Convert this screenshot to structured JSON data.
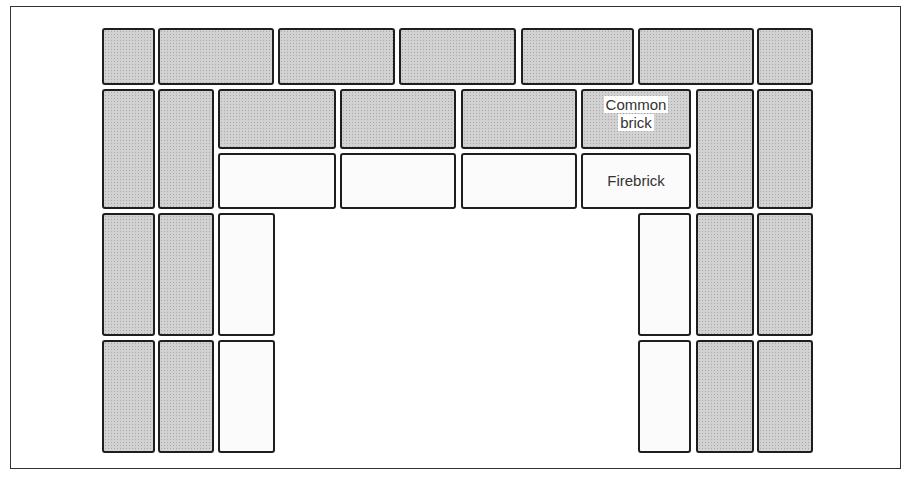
{
  "diagram": {
    "title": "",
    "type": "fireplace brick layout",
    "colors": {
      "common_brick": "#d2d2d2",
      "firebrick": "#fbfbfb",
      "outline": "#1e1e1e"
    },
    "labels": {
      "common_brick_line1": "Common",
      "common_brick_line2": "brick",
      "firebrick": "Firebrick"
    },
    "bricks": [
      {
        "id": "top-1",
        "kind": "common",
        "x": 102,
        "y": 28,
        "w": 53,
        "h": 57
      },
      {
        "id": "top-2",
        "kind": "common",
        "x": 158,
        "y": 28,
        "w": 116,
        "h": 57
      },
      {
        "id": "top-3",
        "kind": "common",
        "x": 278,
        "y": 28,
        "w": 117,
        "h": 57
      },
      {
        "id": "top-4",
        "kind": "common",
        "x": 399,
        "y": 28,
        "w": 117,
        "h": 57
      },
      {
        "id": "top-5",
        "kind": "common",
        "x": 521,
        "y": 28,
        "w": 113,
        "h": 57
      },
      {
        "id": "top-6",
        "kind": "common",
        "x": 638,
        "y": 28,
        "w": 116,
        "h": 57
      },
      {
        "id": "top-7",
        "kind": "common",
        "x": 757,
        "y": 28,
        "w": 56,
        "h": 57
      },
      {
        "id": "r2-left-1",
        "kind": "common",
        "x": 102,
        "y": 89,
        "w": 53,
        "h": 120
      },
      {
        "id": "r2-left-2",
        "kind": "common",
        "x": 158,
        "y": 89,
        "w": 56,
        "h": 120
      },
      {
        "id": "lintel-common-1",
        "kind": "common",
        "x": 218,
        "y": 89,
        "w": 118,
        "h": 60
      },
      {
        "id": "lintel-common-2",
        "kind": "common",
        "x": 340,
        "y": 89,
        "w": 116,
        "h": 60
      },
      {
        "id": "lintel-common-3",
        "kind": "common",
        "x": 461,
        "y": 89,
        "w": 116,
        "h": 60
      },
      {
        "id": "lintel-common-4",
        "kind": "common",
        "x": 581,
        "y": 89,
        "w": 110,
        "h": 60
      },
      {
        "id": "lintel-fire-1",
        "kind": "fire",
        "x": 218,
        "y": 153,
        "w": 118,
        "h": 56
      },
      {
        "id": "lintel-fire-2",
        "kind": "fire",
        "x": 340,
        "y": 153,
        "w": 116,
        "h": 56
      },
      {
        "id": "lintel-fire-3",
        "kind": "fire",
        "x": 461,
        "y": 153,
        "w": 116,
        "h": 56
      },
      {
        "id": "lintel-fire-4",
        "kind": "fire",
        "x": 581,
        "y": 153,
        "w": 110,
        "h": 56
      },
      {
        "id": "r2-right-1",
        "kind": "common",
        "x": 696,
        "y": 89,
        "w": 58,
        "h": 120
      },
      {
        "id": "r2-right-2",
        "kind": "common",
        "x": 757,
        "y": 89,
        "w": 56,
        "h": 120
      },
      {
        "id": "r3-left-1",
        "kind": "common",
        "x": 102,
        "y": 213,
        "w": 53,
        "h": 123
      },
      {
        "id": "r3-left-2",
        "kind": "common",
        "x": 158,
        "y": 213,
        "w": 56,
        "h": 123
      },
      {
        "id": "r3-left-fire",
        "kind": "fire",
        "x": 218,
        "y": 213,
        "w": 57,
        "h": 123
      },
      {
        "id": "r3-right-fire",
        "kind": "fire",
        "x": 638,
        "y": 213,
        "w": 53,
        "h": 123
      },
      {
        "id": "r3-right-1",
        "kind": "common",
        "x": 696,
        "y": 213,
        "w": 58,
        "h": 123
      },
      {
        "id": "r3-right-2",
        "kind": "common",
        "x": 757,
        "y": 213,
        "w": 56,
        "h": 123
      },
      {
        "id": "r4-left-1",
        "kind": "common",
        "x": 102,
        "y": 340,
        "w": 53,
        "h": 113
      },
      {
        "id": "r4-left-2",
        "kind": "common",
        "x": 158,
        "y": 340,
        "w": 56,
        "h": 113
      },
      {
        "id": "r4-left-fire",
        "kind": "fire",
        "x": 218,
        "y": 340,
        "w": 57,
        "h": 113
      },
      {
        "id": "r4-right-fire",
        "kind": "fire",
        "x": 638,
        "y": 340,
        "w": 53,
        "h": 113
      },
      {
        "id": "r4-right-1",
        "kind": "common",
        "x": 696,
        "y": 340,
        "w": 58,
        "h": 113
      },
      {
        "id": "r4-right-2",
        "kind": "common",
        "x": 757,
        "y": 340,
        "w": 56,
        "h": 113
      }
    ]
  }
}
